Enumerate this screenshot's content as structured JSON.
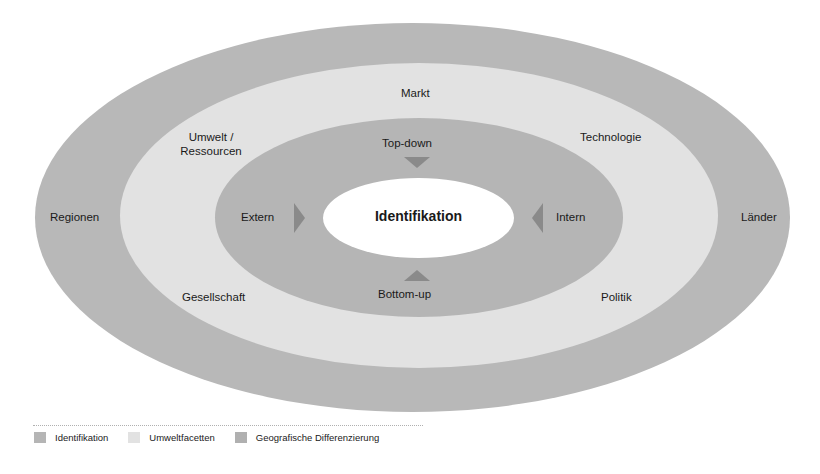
{
  "diagram": {
    "center": "Identifikation",
    "inner_ring": {
      "top": "Top-down",
      "bottom": "Bottom-up",
      "left": "Extern",
      "right": "Intern"
    },
    "middle_ring": {
      "top": "Markt",
      "top_left_line1": "Umwelt /",
      "top_left_line2": "Ressourcen",
      "top_right": "Technologie",
      "bottom_left": "Gesellschaft",
      "bottom_right": "Politik"
    },
    "outer_ring": {
      "left": "Regionen",
      "right": "Länder"
    },
    "colors": {
      "outer": "#b8b8b8",
      "middle": "#e2e2e2",
      "inner": "#b5b5b5",
      "center": "#ffffff",
      "arrows": "#8a8a8a"
    }
  },
  "legend": [
    {
      "label": "Identifikation",
      "color": "#b5b5b5"
    },
    {
      "label": "Umweltfacetten",
      "color": "#e2e2e2"
    },
    {
      "label": "Geografische Differenzierung",
      "color": "#b0b0b0"
    }
  ]
}
